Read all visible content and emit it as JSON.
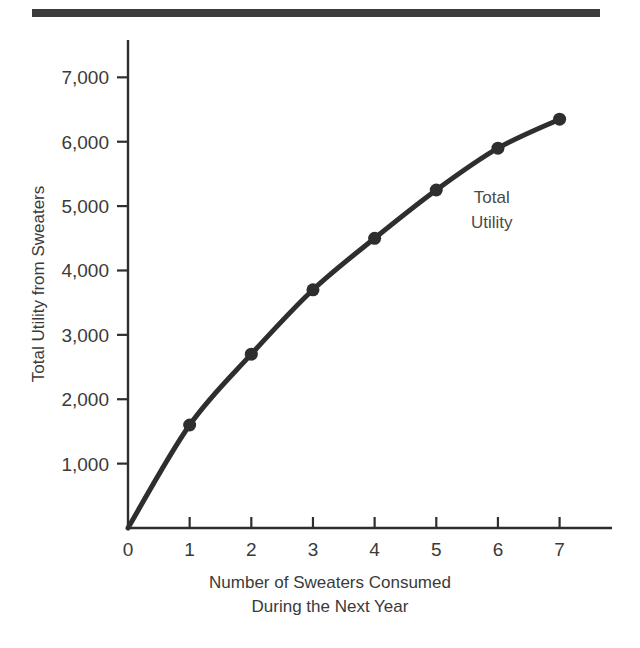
{
  "figure": {
    "decorative_top_rule": true,
    "background_color": "#ffffff",
    "ink_color": "#3a3a3a"
  },
  "chart_data": {
    "type": "line",
    "title": "",
    "subtitle": "",
    "xlabel_lines": [
      "Number of Sweaters Consumed",
      "During the Next Year"
    ],
    "ylabel": "Total Utility from Sweaters",
    "x": [
      0,
      1,
      2,
      3,
      4,
      5,
      6,
      7
    ],
    "values": [
      0,
      1600,
      2700,
      3700,
      4500,
      5250,
      5900,
      6350
    ],
    "series": [
      {
        "name": "Total Utility",
        "x": [
          0,
          1,
          2,
          3,
          4,
          5,
          6,
          7
        ],
        "values": [
          0,
          1600,
          2700,
          3700,
          4500,
          5250,
          5900,
          6350
        ],
        "line_color": "#2e2e2e",
        "marker": "circle",
        "marker_shown_at_origin": false
      }
    ],
    "annotations": [
      {
        "text_lines": [
          "Total",
          "Utility"
        ],
        "x_value": 5.9,
        "y_value": 5050
      }
    ],
    "xlim": [
      0,
      7.85
    ],
    "ylim": [
      0,
      7580
    ],
    "xticks": [
      0,
      1,
      2,
      3,
      4,
      5,
      6,
      7
    ],
    "xtick_labels": [
      "0",
      "1",
      "2",
      "3",
      "4",
      "5",
      "6",
      "7"
    ],
    "yticks": [
      1000,
      2000,
      3000,
      4000,
      5000,
      6000,
      7000
    ],
    "ytick_labels": [
      "1,000",
      "2,000",
      "3,000",
      "4,000",
      "5,000",
      "6,000",
      "7,000"
    ],
    "grid": false,
    "legend_position": "none"
  }
}
